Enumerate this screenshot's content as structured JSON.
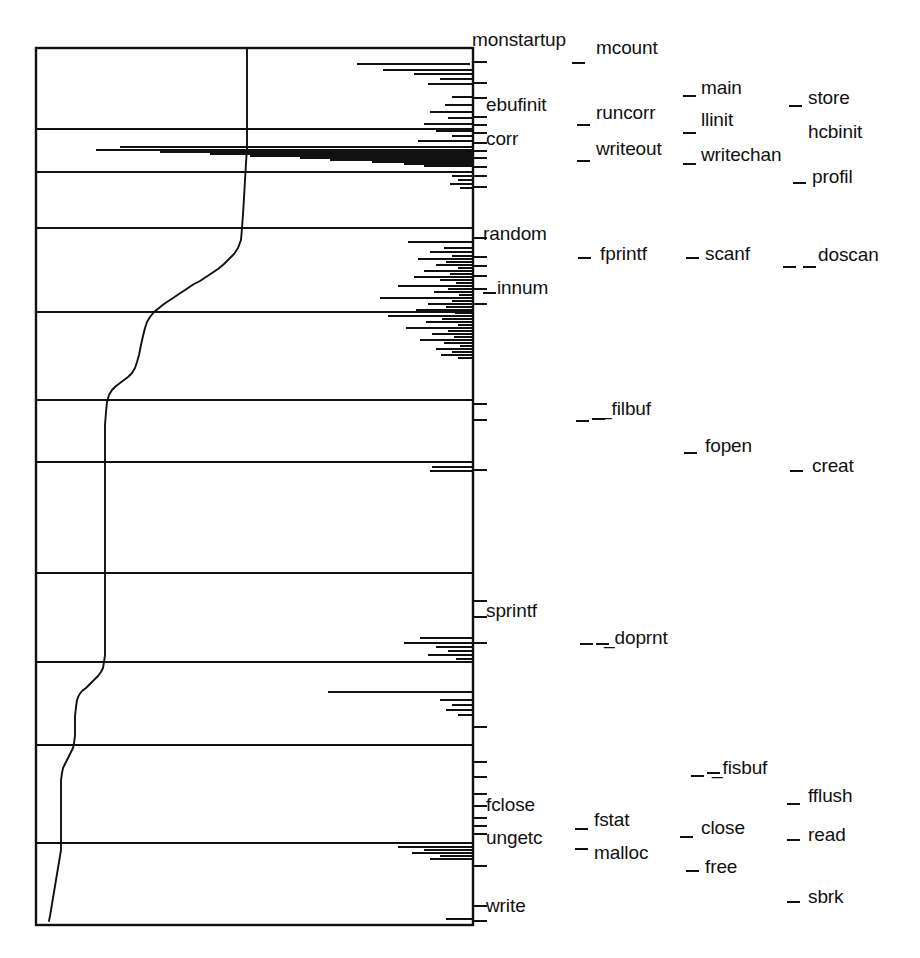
{
  "figure": {
    "kind": "program-execution-address-trace",
    "caption_present": false,
    "background_color": "#ffffff",
    "ink_color": "#111111"
  },
  "chart_data": {
    "type": "line",
    "title": "",
    "subtitle": "",
    "xlabel": "",
    "ylabel": "",
    "xlim": [
      0,
      1
    ],
    "ylim": [
      0,
      1
    ],
    "grid": true,
    "grid_axis": "y",
    "legend_position": "none",
    "axes_note": "x = execution time (left to right), y = memory address / text-segment offset (top to bottom); right-hand tick marks locate named routines",
    "frame": {
      "left": 36,
      "top": 48,
      "right": 473,
      "bottom": 925
    },
    "gridlines_y": [
      129,
      172,
      228,
      312,
      400,
      462,
      573,
      662,
      745,
      843
    ],
    "axis_ticks_right_y": [
      62,
      83,
      98,
      117,
      125,
      133,
      143,
      151,
      158,
      167,
      176,
      187,
      238,
      257,
      266,
      276,
      289,
      304,
      404,
      420,
      470,
      601,
      617,
      643,
      727,
      762,
      777,
      794,
      806,
      818,
      826,
      834,
      866,
      906,
      921
    ],
    "series": [
      {
        "name": "instruction-pointer trace",
        "description": "monotone staircase descending from upper-right toward lower-left then dropping to the bottom of the address space",
        "points": [
          [
            0.78,
            0.055
          ],
          [
            0.78,
            0.12
          ],
          [
            0.5,
            0.125
          ],
          [
            0.49,
            0.22
          ],
          [
            0.49,
            0.24
          ],
          [
            0.47,
            0.255
          ],
          [
            0.45,
            0.27
          ],
          [
            0.42,
            0.285
          ],
          [
            0.38,
            0.3
          ],
          [
            0.33,
            0.315
          ],
          [
            0.3,
            0.325
          ],
          [
            0.27,
            0.335
          ],
          [
            0.24,
            0.35
          ],
          [
            0.22,
            0.365
          ],
          [
            0.2,
            0.38
          ],
          [
            0.18,
            0.4
          ],
          [
            0.17,
            0.41
          ],
          [
            0.155,
            0.42
          ],
          [
            0.148,
            0.435
          ],
          [
            0.145,
            0.47
          ],
          [
            0.145,
            0.52
          ],
          [
            0.145,
            0.6
          ],
          [
            0.145,
            0.64
          ],
          [
            0.143,
            0.655
          ],
          [
            0.13,
            0.665
          ],
          [
            0.12,
            0.672
          ],
          [
            0.108,
            0.685
          ],
          [
            0.105,
            0.72
          ],
          [
            0.105,
            0.755
          ],
          [
            0.1,
            0.775
          ],
          [
            0.082,
            0.785
          ],
          [
            0.075,
            0.8
          ],
          [
            0.072,
            0.86
          ],
          [
            0.072,
            0.95
          ],
          [
            0.068,
            0.97
          ]
        ]
      },
      {
        "name": "reference density band",
        "description": "dense horizontal hairline bursts clustered against the right edge marking repeated library calls"
      }
    ]
  },
  "labels": {
    "column_1": [
      {
        "id": "monstartup",
        "text": "monstartup",
        "x": 472,
        "y": 30,
        "dash": false
      },
      {
        "id": "ebufinit",
        "text": "ebufinit",
        "x": 486,
        "y": 95,
        "dash": false
      },
      {
        "id": "corr",
        "text": "corr",
        "x": 486,
        "y": 129,
        "dash": false
      },
      {
        "id": "random",
        "text": "random",
        "x": 483,
        "y": 224,
        "dash": false
      },
      {
        "id": "innum",
        "text": "innum",
        "x": 497,
        "y": 278,
        "dash": true,
        "dash_x": 483,
        "dash_y": 292
      },
      {
        "id": "sprintf",
        "text": "sprintf",
        "x": 486,
        "y": 601,
        "dash": false
      },
      {
        "id": "fclose",
        "text": "fclose",
        "x": 486,
        "y": 795,
        "dash": false
      },
      {
        "id": "ungetc",
        "text": "ungetc",
        "x": 486,
        "y": 828,
        "dash": false
      },
      {
        "id": "write",
        "text": "write",
        "x": 486,
        "y": 896,
        "dash": false
      }
    ],
    "column_2": [
      {
        "id": "mcount",
        "text": "mcount",
        "x": 596,
        "y": 38,
        "dash": true,
        "dash_x": 572,
        "dash_y": 62
      },
      {
        "id": "runcorr",
        "text": "runcorr",
        "x": 596,
        "y": 103,
        "dash": true,
        "dash_x": 577,
        "dash_y": 124
      },
      {
        "id": "writeout",
        "text": "writeout",
        "x": 596,
        "y": 139,
        "dash": true,
        "dash_x": 577,
        "dash_y": 160
      },
      {
        "id": "fprintf",
        "text": "fprintf",
        "x": 600,
        "y": 244,
        "dash": true,
        "dash_x": 578,
        "dash_y": 257
      },
      {
        "id": "filbuf",
        "text": "_filbuf",
        "x": 601,
        "y": 399,
        "dash": true,
        "dash_x": 576,
        "dash_y": 420
      },
      {
        "id": "doprnt",
        "text": "_doprnt",
        "x": 604,
        "y": 628,
        "dash": true,
        "dash_x": 580,
        "dash_y": 643
      },
      {
        "id": "fstat",
        "text": "fstat",
        "x": 594,
        "y": 810,
        "dash": true,
        "dash_x": 575,
        "dash_y": 828
      },
      {
        "id": "malloc",
        "text": "malloc",
        "x": 594,
        "y": 843,
        "dash": true,
        "dash_x": 575,
        "dash_y": 848
      }
    ],
    "column_3": [
      {
        "id": "main",
        "text": "main",
        "x": 701,
        "y": 78,
        "dash": true,
        "dash_x": 683,
        "dash_y": 95
      },
      {
        "id": "llinit",
        "text": "llinit",
        "x": 701,
        "y": 110,
        "dash": true,
        "dash_x": 683,
        "dash_y": 132
      },
      {
        "id": "writechan",
        "text": "writechan",
        "x": 701,
        "y": 145,
        "dash": true,
        "dash_x": 683,
        "dash_y": 163
      },
      {
        "id": "scanf",
        "text": "scanf",
        "x": 705,
        "y": 244,
        "dash": true,
        "dash_x": 686,
        "dash_y": 257
      },
      {
        "id": "fopen",
        "text": "fopen",
        "x": 705,
        "y": 436,
        "dash": true,
        "dash_x": 684,
        "dash_y": 452
      },
      {
        "id": "fisbuf",
        "text": "_fisbuf",
        "x": 712,
        "y": 758,
        "dash": true,
        "dash_x": 691,
        "dash_y": 775
      },
      {
        "id": "close",
        "text": "close",
        "x": 701,
        "y": 818,
        "dash": true,
        "dash_x": 680,
        "dash_y": 836
      },
      {
        "id": "free",
        "text": "free",
        "x": 705,
        "y": 857,
        "dash": true,
        "dash_x": 686,
        "dash_y": 870
      }
    ],
    "column_4": [
      {
        "id": "store",
        "text": "store",
        "x": 808,
        "y": 88,
        "dash": true,
        "dash_x": 789,
        "dash_y": 105
      },
      {
        "id": "hcbinit",
        "text": "hcbinit",
        "x": 808,
        "y": 122,
        "dash": false
      },
      {
        "id": "profil",
        "text": "profil",
        "x": 812,
        "y": 167,
        "dash": true,
        "dash_x": 793,
        "dash_y": 182
      },
      {
        "id": "doscan",
        "text": "doscan",
        "x": 818,
        "y": 245,
        "dash": true,
        "dash_x": 783,
        "dash_y": 266
      },
      {
        "id": "creat",
        "text": "creat",
        "x": 812,
        "y": 456,
        "dash": true,
        "dash_x": 790,
        "dash_y": 470
      },
      {
        "id": "fflush",
        "text": "fflush",
        "x": 808,
        "y": 786,
        "dash": true,
        "dash_x": 787,
        "dash_y": 803
      },
      {
        "id": "read",
        "text": "read",
        "x": 808,
        "y": 825,
        "dash": true,
        "dash_x": 787,
        "dash_y": 839
      },
      {
        "id": "sbrk",
        "text": "sbrk",
        "x": 808,
        "y": 887,
        "dash": true,
        "dash_x": 787,
        "dash_y": 901
      }
    ],
    "extra_dashes": [
      {
        "id": "doscan-second-dash",
        "x": 803,
        "y": 266
      },
      {
        "id": "filbuf-second-dash",
        "x": 592,
        "y": 418
      },
      {
        "id": "doprnt-second-dash",
        "x": 596,
        "y": 643
      },
      {
        "id": "fisbuf-second-dash",
        "x": 707,
        "y": 772
      }
    ]
  }
}
